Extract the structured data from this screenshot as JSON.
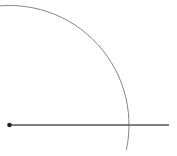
{
  "diagram": {
    "background": "#ffffff",
    "center_point": {
      "x": 9.5,
      "y": 125,
      "r": 2.3,
      "color": "#222222"
    },
    "ray": {
      "x1": 9.5,
      "y1": 125,
      "x2": 169,
      "y2": 125,
      "color": "#555555",
      "width": 1.3
    },
    "arc": {
      "cx": 9.5,
      "cy": 125,
      "radius": 119.5,
      "start_deg": -104,
      "end_deg": 12,
      "color": "#777777",
      "width": 0.9
    }
  }
}
